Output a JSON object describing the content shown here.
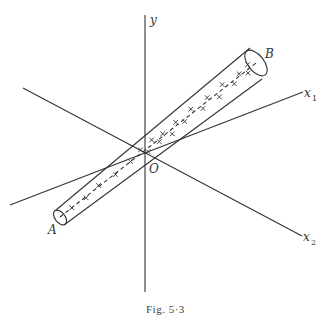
{
  "figure": {
    "caption": "Fig. 5·3",
    "labels": {
      "y_axis": "y",
      "x1_axis": "x",
      "x1_sub": "1",
      "x2_axis": "x",
      "x2_sub": "2",
      "origin": "O",
      "end_a": "A",
      "end_b": "B"
    }
  }
}
